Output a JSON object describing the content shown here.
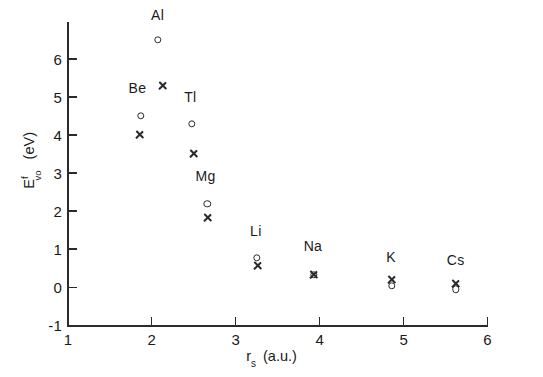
{
  "chart_data": {
    "type": "scatter",
    "title": "",
    "xlabel": "r_s (a.u.)",
    "ylabel": "E^f_vo (eV)",
    "xlim": [
      1,
      6
    ],
    "ylim": [
      -1,
      6.85
    ],
    "grid": false,
    "legend": "none",
    "xticks": [
      "1",
      "2",
      "3",
      "4",
      "5",
      "6"
    ],
    "xtick_values": [
      1,
      2,
      3,
      4,
      5,
      6
    ],
    "yticks": [
      "-1",
      "0",
      "1",
      "2",
      "3",
      "4",
      "5",
      "6"
    ],
    "ytick_values": [
      -1,
      0,
      1,
      2,
      3,
      4,
      5,
      6
    ],
    "series": [
      {
        "name": "circle",
        "marker": "o",
        "points": [
          {
            "label": "Al",
            "x": 2.07,
            "y": 6.5
          },
          {
            "label": "Be",
            "x": 1.87,
            "y": 4.5
          },
          {
            "label": "Tl",
            "x": 2.48,
            "y": 4.3
          },
          {
            "label": "Mg",
            "x": 2.66,
            "y": 2.2
          },
          {
            "label": "Li",
            "x": 3.25,
            "y": 0.78
          },
          {
            "label": "Na",
            "x": 3.93,
            "y": 0.33
          },
          {
            "label": "K",
            "x": 4.86,
            "y": 0.04
          },
          {
            "label": "Cs",
            "x": 5.62,
            "y": -0.05
          }
        ]
      },
      {
        "name": "cross",
        "marker": "x",
        "points": [
          {
            "label": "Al",
            "x": 2.13,
            "y": 5.3
          },
          {
            "label": "Be",
            "x": 1.85,
            "y": 4.0
          },
          {
            "label": "Tl",
            "x": 2.5,
            "y": 3.52
          },
          {
            "label": "Mg",
            "x": 2.67,
            "y": 1.82
          },
          {
            "label": "Li",
            "x": 3.26,
            "y": 0.58
          },
          {
            "label": "Na",
            "x": 3.93,
            "y": 0.33
          },
          {
            "label": "K",
            "x": 4.86,
            "y": 0.2
          },
          {
            "label": "Cs",
            "x": 5.62,
            "y": 0.1
          }
        ]
      }
    ],
    "element_labels": [
      {
        "text": "Al",
        "x": 2.07,
        "y": 6.95
      },
      {
        "text": "Be",
        "x": 1.83,
        "y": 5.02
      },
      {
        "text": "Tl",
        "x": 2.46,
        "y": 4.8
      },
      {
        "text": "Mg",
        "x": 2.64,
        "y": 2.72
      },
      {
        "text": "Li",
        "x": 3.24,
        "y": 1.28
      },
      {
        "text": "Na",
        "x": 3.92,
        "y": 0.88
      },
      {
        "text": "K",
        "x": 4.85,
        "y": 0.58
      },
      {
        "text": "Cs",
        "x": 5.62,
        "y": 0.5
      }
    ]
  }
}
